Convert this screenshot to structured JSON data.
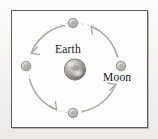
{
  "figure": {
    "kind": "orbit-diagram",
    "frame": {
      "border_color": "#5c5c5c",
      "fill_color": "#fdfdfd",
      "x": 11,
      "y": 10,
      "width": 137,
      "height": 118
    },
    "background_color": "#f2f1f0"
  },
  "labels": {
    "earth": "Earth",
    "moon": "Moon"
  },
  "bodies": {
    "earth": {
      "name": "Earth",
      "cx": 75,
      "cy": 69,
      "radius": 10.5,
      "color": "#9a9a98",
      "highlight_color": "#e8e7e3"
    },
    "moons": [
      {
        "position": "top",
        "cx": 73,
        "cy": 23,
        "radius": 4.6,
        "color": "#b6b5b2"
      },
      {
        "position": "right",
        "cx": 121,
        "cy": 66,
        "radius": 4.6,
        "color": "#b6b5b2"
      },
      {
        "position": "bottom",
        "cx": 73,
        "cy": 113,
        "radius": 4.6,
        "color": "#b6b5b2"
      },
      {
        "position": "left",
        "cx": 26,
        "cy": 66,
        "radius": 4.6,
        "color": "#b6b5b2"
      }
    ]
  },
  "orbit": {
    "cx": 73.5,
    "cy": 68,
    "radius": 45,
    "stroke_color": "#c9c8c5",
    "direction": "counterclockwise",
    "arrow_color": "#a9a8a5",
    "arrow_count": 4
  }
}
